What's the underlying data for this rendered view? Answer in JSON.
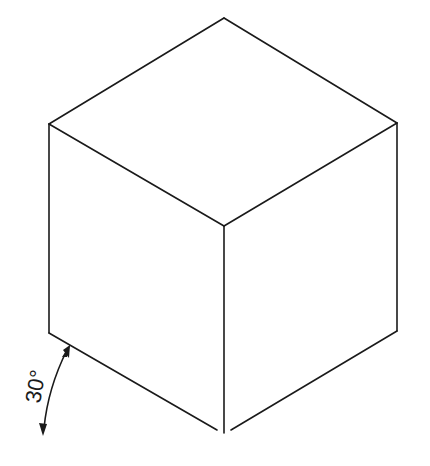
{
  "diagram": {
    "type": "isometric-projection",
    "angle_annotation": {
      "label": "30°",
      "value_degrees": 30
    },
    "colors": {
      "stroke": "#1a1a1a",
      "background": "#ffffff"
    }
  }
}
